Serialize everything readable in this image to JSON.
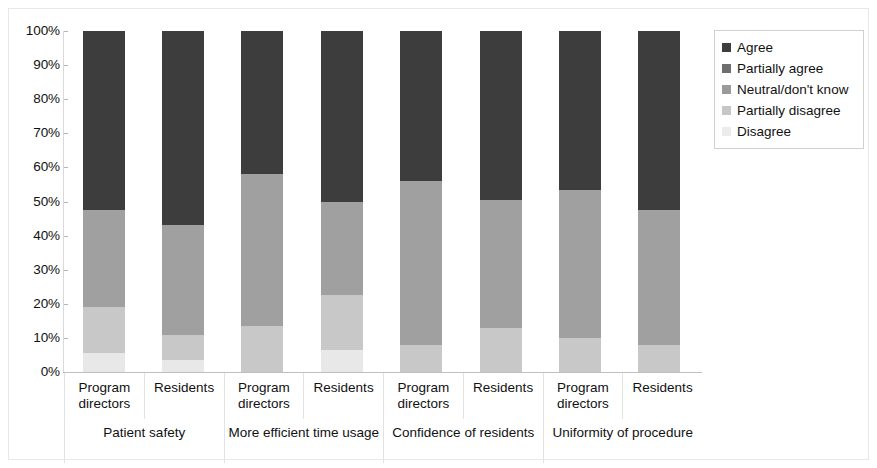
{
  "chart_data": {
    "type": "bar",
    "subtype": "stacked-100-percent",
    "title": "",
    "xlabel": "",
    "ylabel": "",
    "ylim": [
      0,
      100
    ],
    "ytick_labels": [
      "100%",
      "90%",
      "80%",
      "70%",
      "60%",
      "50%",
      "40%",
      "30%",
      "20%",
      "10%",
      "0%"
    ],
    "ytick_values": [
      100,
      90,
      80,
      70,
      60,
      50,
      40,
      30,
      20,
      10,
      0
    ],
    "grid": false,
    "legend_position": "right",
    "categories": [
      "Program directors",
      "Residents",
      "Program directors",
      "Residents",
      "Program directors",
      "Residents",
      "Program directors",
      "Residents"
    ],
    "groups": [
      {
        "label": "Patient safety",
        "span": 2
      },
      {
        "label": "More efficient time usage",
        "span": 2
      },
      {
        "label": "Confidence of residents",
        "span": 2
      },
      {
        "label": "Uniformity of procedure",
        "span": 2
      }
    ],
    "series": [
      {
        "name": "Disagree",
        "color": "#e8e8e8",
        "values": [
          5.5,
          3.5,
          0,
          6.5,
          0,
          0,
          0,
          0
        ]
      },
      {
        "name": "Partially disagree",
        "color": "#c8c8c8",
        "values": [
          13.5,
          7.5,
          13.5,
          16.0,
          8.0,
          13.0,
          10.0,
          8.0
        ]
      },
      {
        "name": "Neutral/don't know",
        "color": "#a0a0a0",
        "values": [
          28.5,
          32.0,
          44.5,
          27.5,
          48.0,
          37.5,
          43.5,
          39.5
        ]
      },
      {
        "name": "Partially agree",
        "color": "#808080",
        "values": [
          0,
          0,
          0,
          0,
          0,
          0,
          0,
          0
        ]
      },
      {
        "name": "Agree",
        "color": "#3d3d3d",
        "values": [
          52.5,
          57.0,
          42.0,
          50.0,
          44.0,
          49.5,
          46.5,
          52.5
        ]
      }
    ],
    "legend_entries": [
      {
        "label": "Agree",
        "color": "#3d3d3d"
      },
      {
        "label": "Partially agree",
        "color": "#6e6e6e"
      },
      {
        "label": "Neutral/don't know",
        "color": "#9a9a9a"
      },
      {
        "label": "Partially disagree",
        "color": "#c6c6c6"
      },
      {
        "label": "Disagree",
        "color": "#ececec"
      }
    ]
  }
}
